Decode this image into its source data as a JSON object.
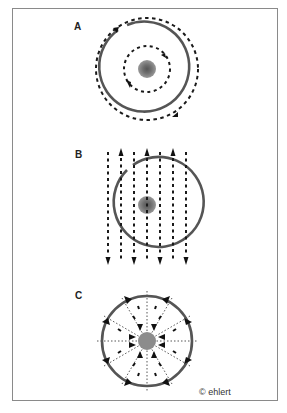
{
  "figure": {
    "panels": [
      {
        "label": "A",
        "description": "Concentric circles with circular dashed field lines around a central charge"
      },
      {
        "label": "B",
        "description": "Circle with parallel vertical dashed field lines, alternating up/down arrows"
      },
      {
        "label": "C",
        "description": "Circle with radial dotted lines and inward-pointing arrows toward central charge"
      }
    ],
    "copyright": "© ehlert"
  },
  "colors": {
    "frame": "#8a8a8a",
    "ring": "#555555",
    "dash": "#1a1a1a",
    "center_outer": "#8c8c8c",
    "center_inner": "#5a5a5a"
  }
}
